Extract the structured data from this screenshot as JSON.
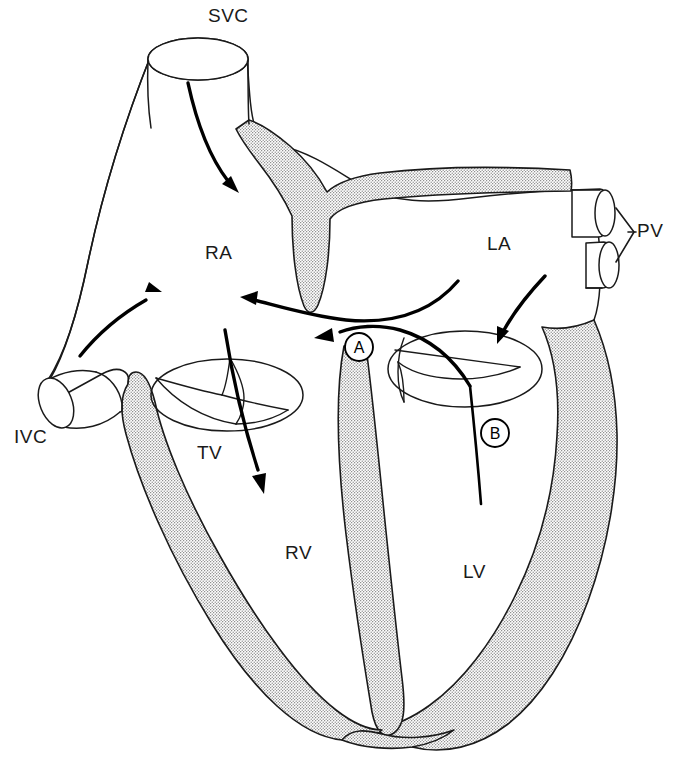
{
  "figure": {
    "type": "anatomical-line-diagram",
    "background_color": "#ffffff",
    "ink_color": "#1a1a1a",
    "myocardium_fill": "stippled-dot-pattern"
  },
  "labels": {
    "svc": "SVC",
    "ivc": "IVC",
    "ra": "RA",
    "la": "LA",
    "rv": "RV",
    "lv": "LV",
    "tv": "TV",
    "pv": "PV"
  },
  "markers": [
    {
      "id": "A",
      "text": "A",
      "cx": 359,
      "cy": 347,
      "r": 14
    },
    {
      "id": "B",
      "text": "B",
      "cx": 495,
      "cy": 433,
      "r": 14
    }
  ],
  "structures": [
    {
      "name": "superior-vena-cava",
      "abbr": "SVC",
      "kind": "vessel"
    },
    {
      "name": "inferior-vena-cava",
      "abbr": "IVC",
      "kind": "vessel"
    },
    {
      "name": "pulmonary-veins",
      "abbr": "PV",
      "kind": "vessel",
      "count": 2
    },
    {
      "name": "right-atrium",
      "abbr": "RA",
      "kind": "chamber"
    },
    {
      "name": "left-atrium",
      "abbr": "LA",
      "kind": "chamber"
    },
    {
      "name": "right-ventricle",
      "abbr": "RV",
      "kind": "chamber"
    },
    {
      "name": "left-ventricle",
      "abbr": "LV",
      "kind": "chamber"
    },
    {
      "name": "tricuspid-valve",
      "abbr": "TV",
      "kind": "valve",
      "leaflets": 3
    },
    {
      "name": "mitral-valve",
      "abbr": "MV",
      "kind": "valve",
      "leaflets": 2
    },
    {
      "name": "interatrial-septum",
      "abbr": "IAS",
      "kind": "septum"
    },
    {
      "name": "interventricular-septum",
      "abbr": "IVS",
      "kind": "septum"
    }
  ],
  "flow_arrows": [
    {
      "name": "svc-into-ra",
      "direction": "down-right"
    },
    {
      "name": "ivc-into-ra",
      "direction": "up-right"
    },
    {
      "name": "la-across-septum-to-ra",
      "direction": "left"
    },
    {
      "name": "la-to-mitral-valve",
      "direction": "down-left"
    },
    {
      "name": "ra-through-tricuspid-to-rv",
      "direction": "down-right"
    },
    {
      "name": "catheter-a-to-left-atrium",
      "direction": "left"
    }
  ],
  "catheters": [
    {
      "id": "A",
      "name": "catheter-route-a",
      "target": "left-atrium-via-septum"
    },
    {
      "id": "B",
      "name": "catheter-route-b",
      "target": "left-ventricle-via-mitral-valve"
    }
  ],
  "label_positions": {
    "svc": {
      "x": 208,
      "y": 22
    },
    "ivc": {
      "x": 14,
      "y": 443
    },
    "ra": {
      "x": 205,
      "y": 259
    },
    "la": {
      "x": 487,
      "y": 250
    },
    "rv": {
      "x": 285,
      "y": 559
    },
    "lv": {
      "x": 463,
      "y": 578
    },
    "tv": {
      "x": 197,
      "y": 459
    },
    "pv": {
      "x": 637,
      "y": 237
    }
  }
}
